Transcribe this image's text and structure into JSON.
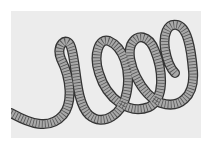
{
  "image": {
    "subject": "coiled-segmented-tube",
    "description": "Illustration of a segmented, ridged tube coiling into four loops from left to right",
    "loops": 4
  },
  "colors": {
    "page_background": "#ffffff",
    "panel_background": "#ececec",
    "tube_fill": "#a9a9a9",
    "tube_outline": "#333333",
    "segment_lines": "#555555"
  },
  "coil_path": "M 0 102 C 18 112, 38 120, 52 104 C 62 92, 60 68, 50 48 C 44 34, 56 24, 60 36 C 66 54, 64 90, 78 104 C 92 116, 112 104, 116 80 C 120 58, 112 36, 98 30 C 88 26, 82 44, 88 62 C 96 88, 118 104, 138 96 C 154 88, 152 60, 144 40 C 138 24, 126 22, 120 34 C 114 50, 130 84, 150 92 C 168 98, 184 86, 182 60 C 180 36, 176 16, 166 14 C 156 12, 152 24, 154 38 C 156 50, 160 58, 164 62"
}
